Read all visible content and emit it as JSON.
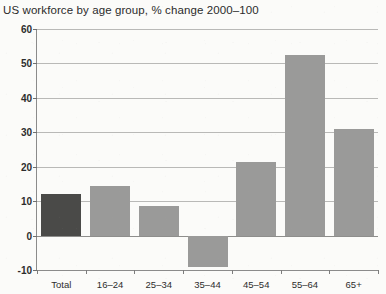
{
  "chart_data": {
    "type": "bar",
    "title": "US workforce by age group, % change 2000–100",
    "xlabel": "",
    "ylabel": "",
    "categories": [
      "Total",
      "16–24",
      "25–34",
      "35–44",
      "45–54",
      "55–64",
      "65+"
    ],
    "values": [
      12,
      14.5,
      8.5,
      -9,
      21.5,
      52.5,
      31
    ],
    "series": [
      {
        "name": "% change 2000–100",
        "values": [
          12,
          14.5,
          8.5,
          -9,
          21.5,
          52.5,
          31
        ]
      }
    ],
    "ylim": [
      -10,
      60
    ],
    "yticks": [
      60,
      50,
      40,
      30,
      20,
      10,
      0,
      -10
    ],
    "ytick_labels": [
      "60",
      "50",
      "40",
      "30",
      "20",
      "10",
      "0",
      "-10"
    ],
    "grid": true,
    "legend": "none",
    "bar_colors": {
      "total": "#4a4a48",
      "default": "#9a9a99"
    },
    "highlight_category": "Total",
    "axis_color": "#8b8b8b",
    "grid_color": "#b9b9b7",
    "background": "#fbfbf9"
  }
}
